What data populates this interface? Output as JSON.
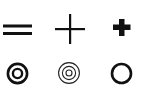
{
  "symbols": [
    {
      "name": "equals-sign",
      "row": 1,
      "col": 1,
      "color": "#111111"
    },
    {
      "name": "thin-cross",
      "row": 1,
      "col": 2,
      "color": "#111111"
    },
    {
      "name": "bold-plus",
      "row": 1,
      "col": 3,
      "color": "#111111"
    },
    {
      "name": "double-ring-bullseye",
      "row": 2,
      "col": 1,
      "color": "#111111"
    },
    {
      "name": "triple-concentric-rings",
      "row": 2,
      "col": 2,
      "color": "#111111"
    },
    {
      "name": "thick-circle",
      "row": 2,
      "col": 3,
      "color": "#111111"
    }
  ],
  "background": "#ffffff"
}
